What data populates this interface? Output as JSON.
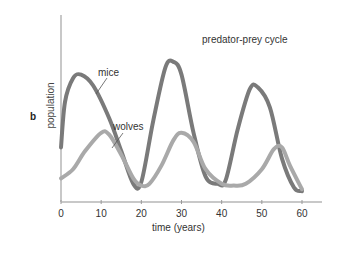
{
  "panel_label": "b",
  "chart_data": {
    "type": "line",
    "title": "predator-prey cycle",
    "xlabel": "time (years)",
    "ylabel": "population",
    "xlim": [
      0,
      60
    ],
    "ylim": [
      0,
      100
    ],
    "x_ticks": [
      0,
      10,
      20,
      30,
      40,
      50,
      60
    ],
    "y_ticks": [],
    "grid": false,
    "legend": "inline labels",
    "series": [
      {
        "name": "mice",
        "color": "#7a7a7a",
        "x": [
          0,
          1,
          3,
          5,
          8,
          12,
          15,
          18,
          20,
          23,
          26,
          28,
          30,
          33,
          36,
          39,
          41,
          44,
          47,
          49,
          52,
          55,
          58,
          60
        ],
        "values": [
          30,
          55,
          68,
          70,
          64,
          46,
          28,
          10,
          11,
          45,
          74,
          77,
          70,
          38,
          14,
          10,
          12,
          40,
          62,
          63,
          52,
          24,
          8,
          6
        ]
      },
      {
        "name": "wolves",
        "color": "#a9a9a9",
        "x": [
          0,
          3,
          6,
          10,
          12,
          15,
          18,
          20,
          22,
          25,
          28,
          30,
          33,
          36,
          40,
          43,
          46,
          50,
          53,
          55,
          57,
          60
        ],
        "values": [
          13,
          18,
          28,
          38,
          37,
          26,
          13,
          9,
          10,
          20,
          34,
          38,
          33,
          18,
          10,
          9,
          10,
          18,
          29,
          30,
          20,
          7
        ]
      }
    ]
  },
  "annotations": {
    "mice": "mice",
    "wolves": "wolves"
  }
}
